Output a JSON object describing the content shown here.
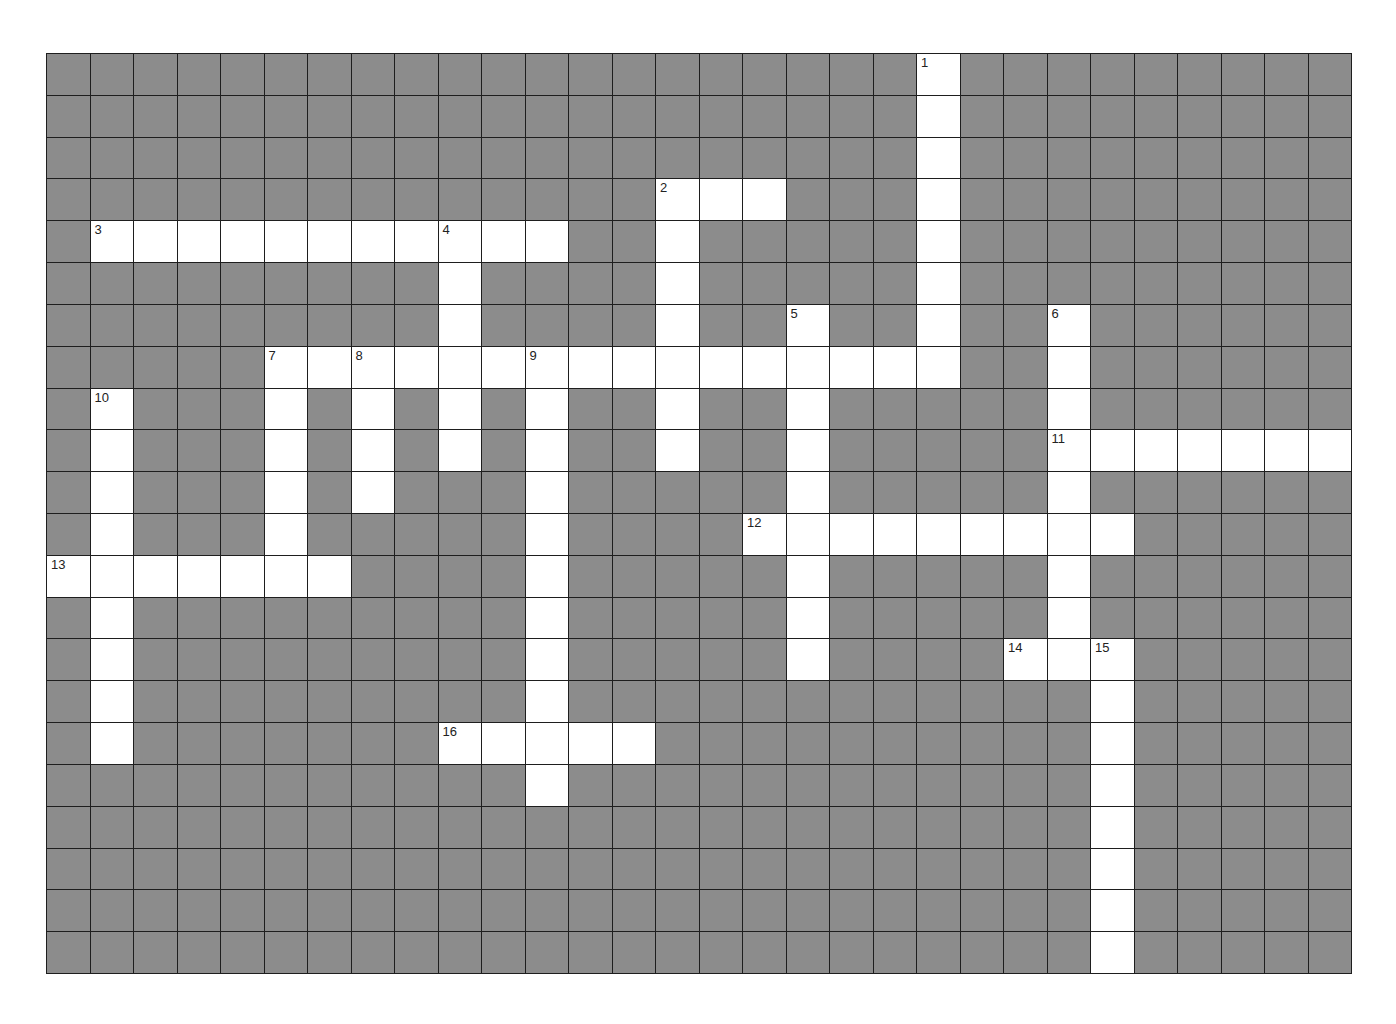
{
  "puzzle": {
    "cols": 30,
    "rows": 22,
    "colors": {
      "block": "#8c8c8c",
      "open": "#ffffff",
      "gridline": "#1e1e1e",
      "number": "#222222"
    },
    "entries": [
      {
        "number": "1",
        "direction": "down",
        "row": 0,
        "col": 20,
        "length": 8
      },
      {
        "number": "2",
        "direction": "across",
        "row": 3,
        "col": 14,
        "length": 3
      },
      {
        "number": "2",
        "direction": "down",
        "row": 3,
        "col": 14,
        "length": 7
      },
      {
        "number": "3",
        "direction": "across",
        "row": 4,
        "col": 1,
        "length": 11
      },
      {
        "number": "4",
        "direction": "down",
        "row": 4,
        "col": 9,
        "length": 6
      },
      {
        "number": "5",
        "direction": "down",
        "row": 6,
        "col": 17,
        "length": 9
      },
      {
        "number": "6",
        "direction": "down",
        "row": 6,
        "col": 23,
        "length": 9
      },
      {
        "number": "7",
        "direction": "across",
        "row": 7,
        "col": 5,
        "length": 16
      },
      {
        "number": "7",
        "direction": "down",
        "row": 7,
        "col": 5,
        "length": 6
      },
      {
        "number": "8",
        "direction": "down",
        "row": 7,
        "col": 7,
        "length": 4
      },
      {
        "number": "9",
        "direction": "down",
        "row": 7,
        "col": 11,
        "length": 11
      },
      {
        "number": "10",
        "direction": "down",
        "row": 8,
        "col": 1,
        "length": 9
      },
      {
        "number": "11",
        "direction": "across",
        "row": 9,
        "col": 23,
        "length": 7
      },
      {
        "number": "12",
        "direction": "across",
        "row": 11,
        "col": 16,
        "length": 9
      },
      {
        "number": "13",
        "direction": "across",
        "row": 12,
        "col": 0,
        "length": 7
      },
      {
        "number": "14",
        "direction": "across",
        "row": 14,
        "col": 22,
        "length": 3
      },
      {
        "number": "15",
        "direction": "down",
        "row": 14,
        "col": 24,
        "length": 8
      },
      {
        "number": "16",
        "direction": "across",
        "row": 16,
        "col": 9,
        "length": 5
      }
    ],
    "numbers": [
      {
        "label": "1",
        "row": 0,
        "col": 20
      },
      {
        "label": "2",
        "row": 3,
        "col": 14
      },
      {
        "label": "3",
        "row": 4,
        "col": 1
      },
      {
        "label": "4",
        "row": 4,
        "col": 9
      },
      {
        "label": "5",
        "row": 6,
        "col": 17
      },
      {
        "label": "6",
        "row": 6,
        "col": 23
      },
      {
        "label": "7",
        "row": 7,
        "col": 5
      },
      {
        "label": "8",
        "row": 7,
        "col": 7
      },
      {
        "label": "9",
        "row": 7,
        "col": 11
      },
      {
        "label": "10",
        "row": 8,
        "col": 1
      },
      {
        "label": "11",
        "row": 9,
        "col": 23
      },
      {
        "label": "12",
        "row": 11,
        "col": 16
      },
      {
        "label": "13",
        "row": 12,
        "col": 0
      },
      {
        "label": "14",
        "row": 14,
        "col": 22
      },
      {
        "label": "15",
        "row": 14,
        "col": 24
      },
      {
        "label": "16",
        "row": 16,
        "col": 9
      }
    ]
  }
}
